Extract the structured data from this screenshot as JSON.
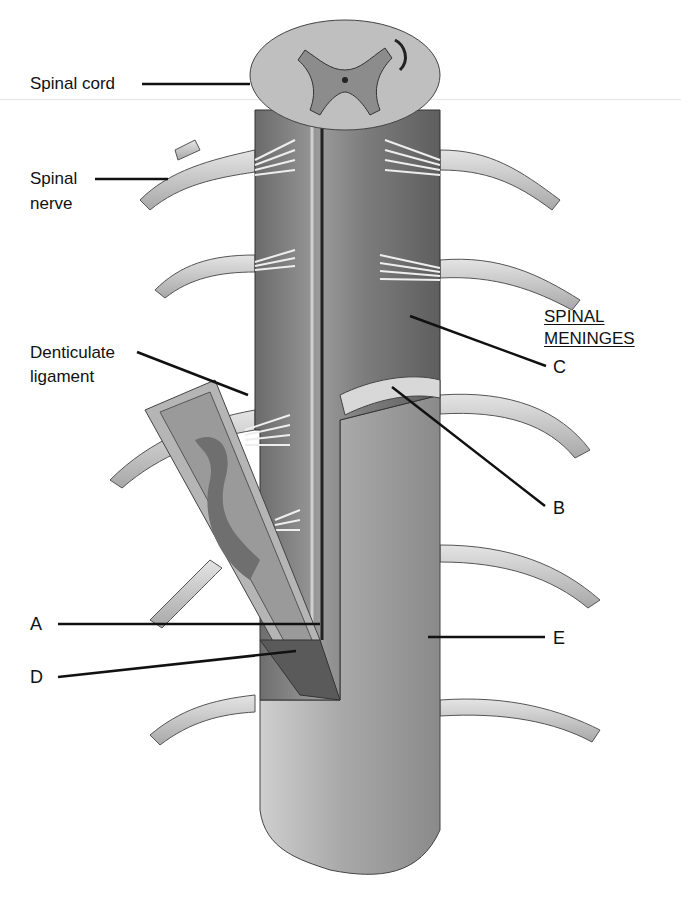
{
  "figure": {
    "palette": {
      "background": "#ffffff",
      "ink": "#111111",
      "light_tissue": "#d9d9d9",
      "mid_tissue": "#a6a6a6",
      "dark_tissue": "#6e6e6e",
      "shadow": "#4a4a4a"
    }
  },
  "labels": {
    "spinal_cord": "Spinal cord",
    "spinal_nerve_line1": "Spinal",
    "spinal_nerve_line2": "nerve",
    "denticulate_line1": "Denticulate",
    "denticulate_line2": "ligament"
  },
  "meninges_heading": {
    "line1": "SPINAL",
    "line2": "MENINGES"
  },
  "letter_labels": {
    "A": "A",
    "B": "B",
    "C": "C",
    "D": "D",
    "E": "E"
  }
}
